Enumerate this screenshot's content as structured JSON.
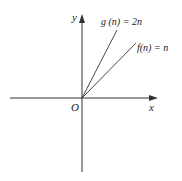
{
  "diagram": {
    "axes": {
      "x_label": "x",
      "y_label": "y",
      "origin_label": "O"
    },
    "functions": [
      {
        "name": "g",
        "arg": "n",
        "expr": "2n",
        "label": "g (n) = 2n",
        "slope": 2
      },
      {
        "name": "f",
        "arg": "n",
        "expr": "n",
        "label": "f(n) = n",
        "slope": 1
      }
    ],
    "colors": {
      "line": "#333333",
      "background": "#ffffff"
    }
  }
}
